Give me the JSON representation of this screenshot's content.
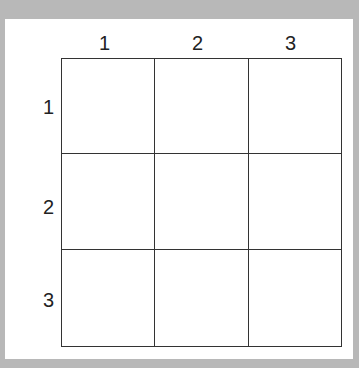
{
  "grid": {
    "rows": 3,
    "cols": 3,
    "column_labels": [
      "1",
      "2",
      "3"
    ],
    "row_labels": [
      "1",
      "2",
      "3"
    ],
    "cells": [
      [
        "",
        "",
        ""
      ],
      [
        "",
        "",
        ""
      ],
      [
        "",
        "",
        ""
      ]
    ]
  }
}
